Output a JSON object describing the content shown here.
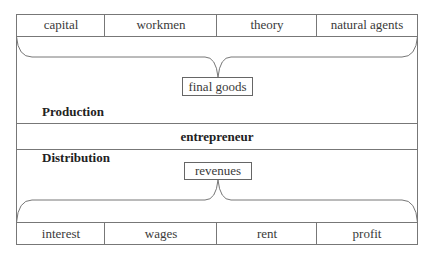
{
  "diagram": {
    "inputs": [
      "capital",
      "workmen",
      "theory",
      "natural agents"
    ],
    "product_box": "final goods",
    "production_label": "Production",
    "center_band": "entrepreneur",
    "distribution_label": "Distribution",
    "revenue_box": "revenues",
    "outputs": [
      "interest",
      "wages",
      "rent",
      "profit"
    ]
  }
}
